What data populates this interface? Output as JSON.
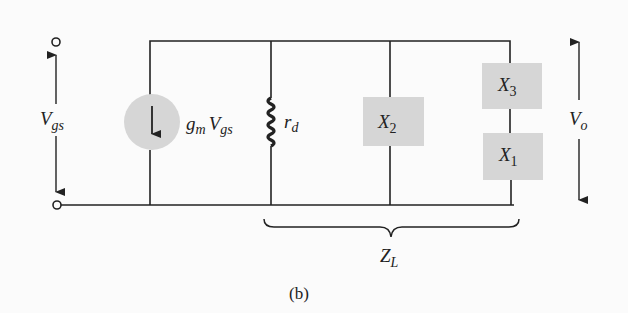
{
  "figure": {
    "caption": "(b)",
    "colors": {
      "wire": "#222222",
      "component_fill": "#d6d6d6",
      "background": "#fbfbfb"
    }
  },
  "labels": {
    "vgs": {
      "main": "V",
      "sub": "gs"
    },
    "source": {
      "g": "g",
      "g_sub": "m",
      "v": "V",
      "v_sub": "gs"
    },
    "rd": {
      "main": "r",
      "sub": "d"
    },
    "x1": {
      "main": "X",
      "sub": "1"
    },
    "x2": {
      "main": "X",
      "sub": "2"
    },
    "x3": {
      "main": "X",
      "sub": "3"
    },
    "vo": {
      "main": "V",
      "sub": "o"
    },
    "zl": {
      "main": "Z",
      "sub": "L"
    }
  },
  "components": [
    {
      "id": "current-source",
      "type": "dependent current source",
      "value": "gm Vgs"
    },
    {
      "id": "rd",
      "type": "resistor",
      "value": "rd"
    },
    {
      "id": "x2",
      "type": "reactance",
      "value": "X2"
    },
    {
      "id": "x3",
      "type": "reactance",
      "value": "X3"
    },
    {
      "id": "x1",
      "type": "reactance",
      "value": "X1"
    }
  ]
}
